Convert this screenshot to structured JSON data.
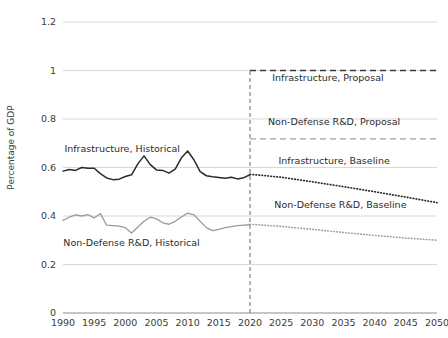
{
  "chart_data": {
    "type": "line",
    "title": "",
    "xlabel": "",
    "ylabel": "Percentage of GDP",
    "xlim": [
      1990,
      2050
    ],
    "ylim": [
      0,
      1.2
    ],
    "ytick_labels": [
      "0",
      "0.2",
      "0.4",
      "0.6",
      "0.8",
      "1",
      "1.2"
    ],
    "ytick_values": [
      0,
      0.2,
      0.4,
      0.6,
      0.8,
      1.0,
      1.2
    ],
    "xtick_labels": [
      "1990",
      "1995",
      "2000",
      "2005",
      "2010",
      "2015",
      "2020",
      "2025",
      "2030",
      "2035",
      "2040",
      "2045",
      "2050"
    ],
    "xtick_values": [
      1990,
      1995,
      2000,
      2005,
      2010,
      2015,
      2020,
      2025,
      2030,
      2035,
      2040,
      2045,
      2050
    ],
    "grid": "horizontal",
    "legend": "inline-annotations",
    "annotations": [
      {
        "name": "infrastructure-historical-label",
        "text": "Infrastructure, Historical",
        "x": 1999.5,
        "y": 0.665
      },
      {
        "name": "non-defense-rnd-historical-label",
        "text": "Non-Defense R&D, Historical",
        "x": 2001.0,
        "y": 0.275
      },
      {
        "name": "infrastructure-proposal-label",
        "text": "Infrastructure, Proposal",
        "x": 2032.5,
        "y": 0.955
      },
      {
        "name": "non-defense-rnd-proposal-label",
        "text": "Non-Defense R&D, Proposal",
        "x": 2033.5,
        "y": 0.775
      },
      {
        "name": "infrastructure-baseline-label",
        "text": "Infrastructure, Baseline",
        "x": 2033.5,
        "y": 0.615
      },
      {
        "name": "non-defense-rnd-baseline-label",
        "text": "Non-Defense R&D, Baseline",
        "x": 2034.5,
        "y": 0.435
      }
    ],
    "marker_line": {
      "name": "present-year-divider",
      "x": 2020,
      "y_from": 0,
      "y_to": 1.0
    },
    "series": [
      {
        "name": "Infrastructure, Historical",
        "style": "solid",
        "color": "#2a2a2a",
        "x": [
          1990,
          1991,
          1992,
          1993,
          1994,
          1995,
          1996,
          1997,
          1998,
          1999,
          2000,
          2001,
          2002,
          2003,
          2004,
          2005,
          2006,
          2007,
          2008,
          2009,
          2010,
          2011,
          2012,
          2013,
          2014,
          2015,
          2016,
          2017,
          2018,
          2019,
          2020
        ],
        "values": [
          0.585,
          0.592,
          0.588,
          0.6,
          0.597,
          0.597,
          0.575,
          0.557,
          0.55,
          0.552,
          0.563,
          0.57,
          0.615,
          0.648,
          0.612,
          0.59,
          0.588,
          0.577,
          0.593,
          0.64,
          0.668,
          0.632,
          0.583,
          0.566,
          0.562,
          0.559,
          0.556,
          0.56,
          0.553,
          0.558,
          0.57
        ]
      },
      {
        "name": "Non-Defense R&D, Historical",
        "style": "solid",
        "color": "#9a9a9a",
        "x": [
          1990,
          1991,
          1992,
          1993,
          1994,
          1995,
          1996,
          1997,
          1998,
          1999,
          2000,
          2001,
          2002,
          2003,
          2004,
          2005,
          2006,
          2007,
          2008,
          2009,
          2010,
          2011,
          2012,
          2013,
          2014,
          2015,
          2016,
          2017,
          2018,
          2019,
          2020
        ],
        "values": [
          0.382,
          0.395,
          0.405,
          0.4,
          0.406,
          0.392,
          0.41,
          0.362,
          0.36,
          0.358,
          0.352,
          0.33,
          0.355,
          0.378,
          0.395,
          0.388,
          0.372,
          0.366,
          0.378,
          0.396,
          0.412,
          0.405,
          0.378,
          0.352,
          0.34,
          0.345,
          0.352,
          0.356,
          0.36,
          0.362,
          0.364
        ]
      },
      {
        "name": "Infrastructure, Proposal",
        "style": "dashed",
        "color": "#3a3a3a",
        "x": [
          2020,
          2050
        ],
        "values": [
          1.0,
          1.0
        ]
      },
      {
        "name": "Non-Defense R&D, Proposal",
        "style": "dashed",
        "color": "#a2a2a2",
        "x": [
          2020,
          2050
        ],
        "values": [
          0.718,
          0.718
        ]
      },
      {
        "name": "Infrastructure, Baseline",
        "style": "dotted",
        "color": "#2a2a2a",
        "x": [
          2020,
          2025,
          2030,
          2035,
          2040,
          2045,
          2050
        ],
        "values": [
          0.572,
          0.56,
          0.541,
          0.521,
          0.5,
          0.478,
          0.455
        ]
      },
      {
        "name": "Non-Defense R&D, Baseline",
        "style": "dotted",
        "color": "#9e9e9e",
        "x": [
          2020,
          2025,
          2030,
          2035,
          2040,
          2045,
          2050
        ],
        "values": [
          0.366,
          0.357,
          0.345,
          0.332,
          0.32,
          0.309,
          0.3
        ]
      }
    ]
  }
}
